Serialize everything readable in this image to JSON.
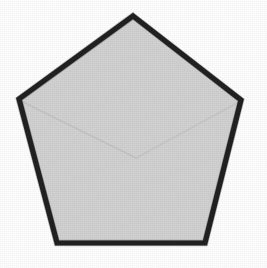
{
  "figure": {
    "shape_name": "regular-pentagon",
    "shape_type": "polygon",
    "sides": 5,
    "caption": "",
    "render_style": "scanned-line-drawing",
    "canvas": {
      "width": 267,
      "height": 268
    },
    "colors": {
      "background": "#ffffff",
      "fill": "#d2d2d2",
      "stroke": "#141414",
      "crease_line": "#bdbdbd"
    },
    "stroke_width": 5,
    "vertices": [
      {
        "name": "apex",
        "x": 133,
        "y": 16
      },
      {
        "name": "right",
        "x": 241,
        "y": 100
      },
      {
        "name": "bottom-right",
        "x": 205,
        "y": 243
      },
      {
        "name": "bottom-left",
        "x": 57,
        "y": 243
      },
      {
        "name": "left",
        "x": 19,
        "y": 99
      }
    ],
    "points_attr": "133,16 241,100 205,243 57,243 19,99",
    "interior_creases": [
      {
        "name": "crease-left",
        "d": "M 21 101 L 136 158"
      },
      {
        "name": "crease-right",
        "d": "M 239 102 L 136 158"
      }
    ]
  }
}
